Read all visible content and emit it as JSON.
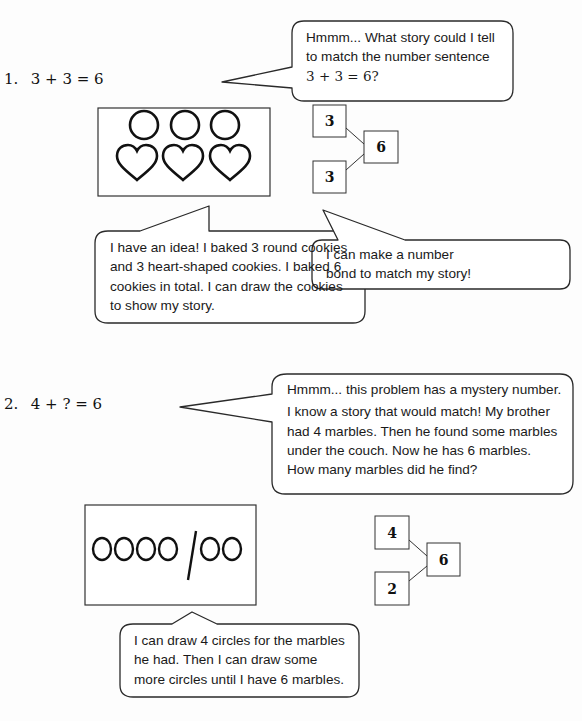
{
  "problems": [
    {
      "number": "1.",
      "equation": "3 + 3 = 6",
      "thought_bubble": {
        "lines": [
          "Hmmm...  What story could I tell",
          "to match the number sentence",
          "3 + 3 = 6?"
        ]
      },
      "drawing": {
        "description": "3 round cookies and 3 heart-shaped cookies",
        "circles": 3,
        "hearts": 3
      },
      "number_bond": {
        "part1": "3",
        "part2": "3",
        "whole": "6"
      },
      "story_bubble": {
        "lines": [
          "I have an idea!  I baked 3 round cookies",
          "and 3 heart-shaped cookies.  I baked 6",
          "cookies in total.  I can draw the cookies",
          "to show my story."
        ]
      },
      "bond_bubble": {
        "lines": [
          "I can make a number",
          "bond to match my story!"
        ]
      }
    },
    {
      "number": "2.",
      "equation": "4 + ? = 6",
      "thought_bubble": {
        "lines": [
          "Hmmm... this problem has a mystery number.",
          "I know a story that would match!  My brother",
          "had 4 marbles.  Then he found some marbles",
          "under the couch.  Now he has 6 marbles.",
          "How many marbles did he find?"
        ]
      },
      "drawing": {
        "description": "4 circles, a dividing line, then 2 circles",
        "circles_before": 4,
        "circles_after": 2
      },
      "number_bond": {
        "part1": "4",
        "part2": "2",
        "whole": "6"
      },
      "story_bubble": {
        "lines": [
          "I can draw 4 circles for the marbles",
          "he had.  Then I can draw some",
          "more circles until I have 6 marbles."
        ]
      }
    }
  ],
  "colors": {
    "ink": "#1a1a1a",
    "line": "#333333",
    "background": "#fdfdfd"
  }
}
